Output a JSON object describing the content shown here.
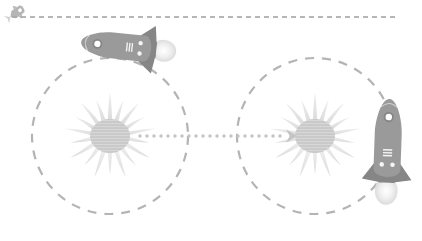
{
  "canvas": {
    "width": 422,
    "height": 241,
    "background": "#ffffff"
  },
  "palette": {
    "dashed_gray": "#b4b4b4",
    "rocket_body": "#9a9a9a",
    "rocket_fin": "#8a8a8a",
    "rocket_detail": "#ffffff",
    "sun_core": "#c9c9c9",
    "sun_ray": "#e2e2e2",
    "dotted_path": "#c4c4c4",
    "top_rule": "#9e9e9e"
  },
  "top_rule": {
    "label": "horizontal dashed rule",
    "x_start": 12,
    "x_end": 399,
    "y": 17,
    "dash": "5 4",
    "stroke_width": 1.6,
    "color": "#9e9e9e"
  },
  "corner_icon": {
    "name": "small-rocket-icon",
    "label": "tiny rocket",
    "x": 9,
    "y": 4,
    "width": 17,
    "height": 16,
    "rotation_deg": -35,
    "color": "#a8a8a8"
  },
  "orbits": [
    {
      "id": "orbit-left",
      "label": "left dashed orbit",
      "cx": 110,
      "cy": 136,
      "r": 78,
      "dash": "9 8",
      "stroke_width": 2.2,
      "color": "#b4b4b4"
    },
    {
      "id": "orbit-right",
      "label": "right dashed orbit",
      "cx": 315,
      "cy": 136,
      "r": 78,
      "dash": "9 8",
      "stroke_width": 2.2,
      "color": "#b4b4b4"
    }
  ],
  "suns": [
    {
      "id": "sun-left",
      "label": "left sun",
      "cx": 110,
      "cy": 136,
      "core_rx": 20,
      "core_ry": 17,
      "ray_count": 18,
      "ray_outer": 46,
      "core_color": "#c9c9c9",
      "ray_color": "#e2e2e2"
    },
    {
      "id": "sun-right",
      "label": "right sun",
      "cx": 315,
      "cy": 136,
      "core_rx": 20,
      "core_ry": 17,
      "ray_count": 18,
      "ray_outer": 46,
      "core_color": "#c9c9c9",
      "ray_color": "#e2e2e2"
    }
  ],
  "connector": {
    "label": "dotted arrow between suns",
    "x_start": 140,
    "x_end": 285,
    "y": 136,
    "dot_radius": 1.7,
    "dot_spacing": 7,
    "color": "#c4c4c4",
    "arrowhead": {
      "x": 288,
      "y": 136,
      "size": 9,
      "direction": "right"
    }
  },
  "rockets": [
    {
      "id": "rocket-left",
      "label": "left rocket",
      "cx": 118,
      "cy": 46,
      "length": 74,
      "width": 26,
      "rotation_deg": 186,
      "nose_direction": "left",
      "flame": true,
      "flame_color": "#e6e6e6",
      "body_color": "#9a9a9a",
      "fin_color": "#868686",
      "porthole_count": 1,
      "stripe_count": 3
    },
    {
      "id": "rocket-right",
      "label": "right rocket",
      "cx": 388,
      "cy": 140,
      "length": 82,
      "width": 27,
      "rotation_deg": 272,
      "nose_direction": "down",
      "flame": true,
      "flame_color": "#e6e6e6",
      "body_color": "#9a9a9a",
      "fin_color": "#868686",
      "porthole_count": 1,
      "stripe_count": 3
    }
  ],
  "accessibility": {
    "diagram_title": "Two suns with dashed orbits connected by a dotted arrow, rockets travelling between them"
  }
}
